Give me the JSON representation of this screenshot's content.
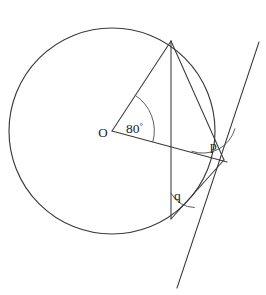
{
  "figure": {
    "type": "geometry-diagram",
    "background_color": "#ffffff",
    "stroke_color": "#3a3a3a",
    "label_color": "#1a1a1a"
  },
  "labels": {
    "centre": "O",
    "central_angle": "80",
    "degree_symbol": "°",
    "angle_p": "p",
    "angle_q": "q"
  },
  "geometry": {
    "circle": {
      "cx": 112,
      "cy": 131,
      "r": 103
    },
    "points": {
      "O": {
        "x": 112,
        "y": 131
      },
      "A": {
        "x": 171,
        "y": 41
      },
      "B": {
        "x": 171,
        "y": 219
      },
      "P": {
        "x": 224,
        "y": 160
      }
    },
    "segments": [
      {
        "name": "radius-OA",
        "from": "O",
        "to": "A"
      },
      {
        "name": "radius-OP-extended",
        "from": "O",
        "to": "P"
      },
      {
        "name": "chord-AB",
        "from": "A",
        "to": "B"
      },
      {
        "name": "chord-AP",
        "from": "A",
        "to": "P"
      },
      {
        "name": "chord-BP",
        "from": "B",
        "to": "P"
      }
    ],
    "tangent_line": {
      "x1": 259,
      "y1": 42,
      "x2": 177,
      "y2": 288
    },
    "arcs": [
      {
        "name": "arc-central-angle",
        "vertex": "O",
        "radius": 42
      },
      {
        "name": "arc-angle-p",
        "vertex": "P",
        "radius": 33
      },
      {
        "name": "arc-angle-q",
        "vertex": "B",
        "radius": 26
      }
    ],
    "label_positions": {
      "O": {
        "x": 103,
        "y": 137
      },
      "central_angle": {
        "x": 126,
        "y": 133
      },
      "p": {
        "x": 210,
        "y": 150
      },
      "q": {
        "x": 174,
        "y": 200
      }
    }
  }
}
